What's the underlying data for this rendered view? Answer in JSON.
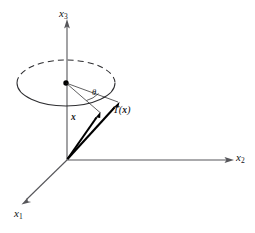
{
  "figure": {
    "kind": "3d-axis-rotation-diagram",
    "background_color": "#ffffff",
    "width": 255,
    "height": 233,
    "caption": "",
    "axis_color": "#56565a",
    "curve_color": "#2e2e31",
    "vector_color": "#000000"
  },
  "axes": [
    {
      "id": "x3",
      "label": "x",
      "subscript": "3",
      "direction": "up",
      "from": [
        67,
        160
      ],
      "to": [
        67,
        22
      ]
    },
    {
      "id": "x2",
      "label": "x",
      "subscript": "2",
      "direction": "right",
      "from": [
        67,
        160
      ],
      "to": [
        232,
        160
      ]
    },
    {
      "id": "x1",
      "label": "x",
      "subscript": "1",
      "direction": "down-left",
      "from": [
        67,
        160
      ],
      "to": [
        22,
        204
      ]
    }
  ],
  "circle": {
    "center": [
      66,
      83
    ],
    "radius_x": 49,
    "radius_y": 23,
    "front_style": "solid",
    "back_style": "dashed",
    "center_dot_radius": 2.6
  },
  "vectors": [
    {
      "id": "x",
      "label": "x",
      "bold": true,
      "origin": [
        67,
        160
      ],
      "tip": [
        100,
        113
      ]
    },
    {
      "id": "Tx",
      "label_prefix": "T",
      "label_open": "(",
      "label_var": "x",
      "label_close": ")",
      "label_text": "T(x)",
      "bold_var": true,
      "origin": [
        67,
        160
      ],
      "tip": [
        119,
        102
      ]
    }
  ],
  "angle": {
    "symbol": "θ",
    "vertex": [
      66,
      83
    ],
    "between": [
      "x",
      "Tx"
    ],
    "arc_style": "thin"
  }
}
